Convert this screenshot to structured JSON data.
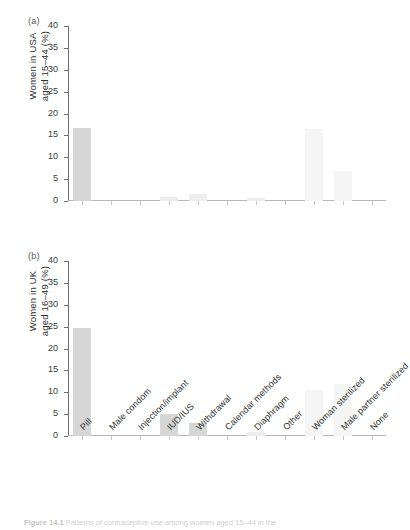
{
  "figure": {
    "panel_a_tag": "(a)",
    "panel_b_tag": "(b)",
    "caption_prefix": "Figure 14.1",
    "caption_text": " Patterns of contraceptive use among women aged 15–44 in the"
  },
  "chart_data": [
    {
      "type": "bar",
      "panel": "(a)",
      "title": "",
      "xlabel": "",
      "ylabel": "Women in USA aged 15–44 (%)",
      "ylabel_line1": "Women in USA",
      "ylabel_line2": "aged 15–44  (%)",
      "ylim": [
        0,
        40
      ],
      "yticks": [
        0,
        5,
        10,
        15,
        20,
        25,
        30,
        35,
        40
      ],
      "grid": false,
      "legend": "none",
      "categories": [
        "Pill",
        "Male condom",
        "Injection/implant",
        "IUD/IUS",
        "Withdrawal",
        "Calendar methods",
        "Diaphragm",
        "Other",
        "Woman sterilized",
        "Male partner sterilized",
        "None"
      ],
      "values": [
        16.8,
        0.0,
        0.0,
        1.0,
        1.6,
        0.0,
        0.6,
        0.0,
        16.4,
        6.8,
        0.0
      ],
      "bar_color": "#d6d6d6"
    },
    {
      "type": "bar",
      "panel": "(b)",
      "title": "",
      "xlabel": "",
      "ylabel": "Women in UK aged 16–49 (%)",
      "ylabel_line1": "Women in UK",
      "ylabel_line2": "aged 16–49  (%)",
      "ylim": [
        0,
        40
      ],
      "yticks": [
        0,
        5,
        10,
        15,
        20,
        25,
        30,
        35,
        40
      ],
      "grid": false,
      "legend": "none",
      "categories": [
        "Pill",
        "Male condom",
        "Injection/implant",
        "IUD/IUS",
        "Withdrawal",
        "Calendar methods",
        "Diaphragm",
        "Other",
        "Woman sterilized",
        "Male partner sterilized",
        "None"
      ],
      "values": [
        24.8,
        0.0,
        0.0,
        5.0,
        2.9,
        0.0,
        0.9,
        0.0,
        10.5,
        11.9,
        0.0
      ],
      "bar_color": "#d6d6d6"
    }
  ]
}
